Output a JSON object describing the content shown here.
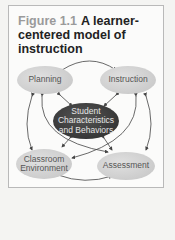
{
  "figure": {
    "label": "Figure 1.1",
    "title": "A learner-centered model of instruction"
  },
  "nodes": {
    "planning": "Planning",
    "instruction": "Instruction",
    "center_line1": "Student",
    "center_line2": "Characteristics",
    "center_line3": "and Behaviors",
    "classroom_line1": "Classroom",
    "classroom_line2": "Environment",
    "assessment": "Assessment"
  },
  "colors": {
    "node_fill": "#cfcfcf",
    "center_fill": "#3a3a3a",
    "arrow": "#444444"
  }
}
